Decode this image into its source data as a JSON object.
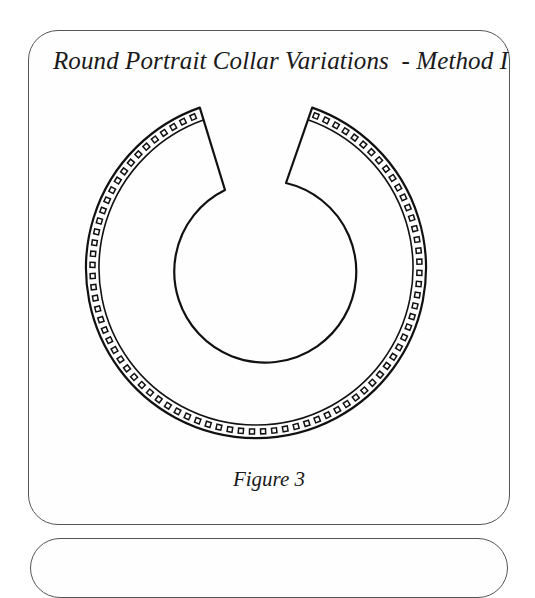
{
  "page": {
    "title": "Round Portrait Collar Variations  - Method I",
    "caption": "Figure 3"
  },
  "figure": {
    "collar": {
      "center": [
        256,
        268
      ],
      "outer_radius": 170,
      "band_inner_radius": 157,
      "start_angle_deg": -70.7,
      "end_angle_deg": 250.7,
      "right_inner_corner": [
        286,
        183
      ],
      "left_inner_corner": [
        225,
        190
      ],
      "neck_center": [
        255,
        272
      ],
      "neck_radius": 91,
      "trim_square_size": 5,
      "trim_spacing_deg": 3.9,
      "stroke_color": "#111111"
    }
  }
}
